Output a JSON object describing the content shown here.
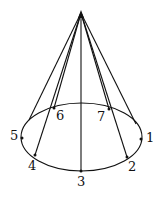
{
  "diagram": {
    "stroke_color": "#111111",
    "background": "#ffffff",
    "apex": {
      "x": 81,
      "y": 13
    },
    "base_ellipse": {
      "cx": 81.5,
      "cy": 137,
      "rx": 60.5,
      "ry": 34
    },
    "silhouette": {
      "left": {
        "x": 29,
        "y": 120
      },
      "right": {
        "x": 136,
        "y": 124
      }
    },
    "points": [
      {
        "label": "1",
        "x": 141,
        "y": 139,
        "lx": 146,
        "ly": 142
      },
      {
        "label": "2",
        "x": 127,
        "y": 157,
        "lx": 128,
        "ly": 171
      },
      {
        "label": "3",
        "x": 81,
        "y": 171,
        "lx": 77,
        "ly": 186
      },
      {
        "label": "4",
        "x": 35,
        "y": 155,
        "lx": 28,
        "ly": 170
      },
      {
        "label": "5",
        "x": 22,
        "y": 138,
        "lx": 10,
        "ly": 140
      },
      {
        "label": "6",
        "x": 54,
        "y": 108,
        "lx": 56,
        "ly": 120
      },
      {
        "label": "7",
        "x": 109,
        "y": 109,
        "lx": 97,
        "ly": 121
      }
    ],
    "edges_from_apex": [
      "silhouette-left",
      "4",
      "6",
      "3",
      "7",
      "2",
      "silhouette-right"
    ]
  }
}
